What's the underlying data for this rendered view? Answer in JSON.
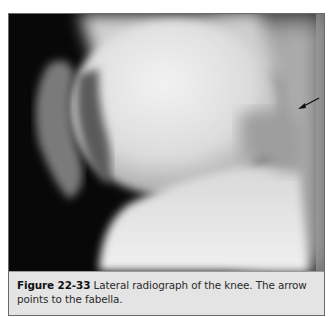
{
  "figure": {
    "label": "Figure 22-33",
    "caption_text": " Lateral radiograph of the knee. The arrow points to the fabella.",
    "image_description": "Lateral knee radiograph (X-ray) showing femoral condyles, patella, tibial plateau",
    "annotation": {
      "type": "arrow",
      "target": "fabella",
      "color": "#111111"
    }
  },
  "colors": {
    "caption_bg": "#e4e4e4",
    "border": "#6a6a6a",
    "film_dark": "#0a0a0a"
  }
}
